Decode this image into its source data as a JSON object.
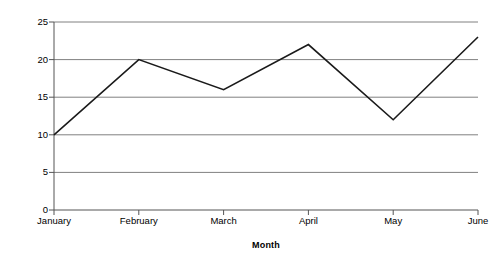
{
  "chart_data": {
    "type": "line",
    "title": "",
    "subtitle": "",
    "xlabel": "Month",
    "ylabel": "Price",
    "categories": [
      "January",
      "February",
      "March",
      "April",
      "May",
      "June"
    ],
    "values": [
      10,
      20,
      16,
      22,
      12,
      23
    ],
    "series": [
      {
        "name": "Price",
        "values": [
          10,
          20,
          16,
          22,
          12,
          23
        ]
      }
    ],
    "ylim": [
      0,
      25
    ],
    "yticks": [
      0,
      5,
      10,
      15,
      20,
      25
    ],
    "ytick_labels": [
      "0",
      "5",
      "10",
      "15",
      "20",
      "25"
    ],
    "xtick_labels": [
      "January",
      "February",
      "March",
      "April",
      "May",
      "June"
    ],
    "grid": true,
    "grid_axis": "y",
    "legend": false,
    "legend_position": "none",
    "colors": {
      "line": "#1a1a1a",
      "grid": "#808080",
      "axis": "#555555",
      "background": "#ffffff",
      "text": "#000000"
    },
    "annotations": []
  }
}
